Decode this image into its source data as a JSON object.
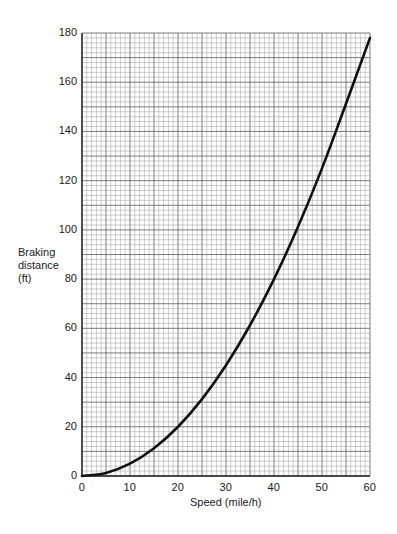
{
  "chart_data": {
    "type": "line",
    "title": "",
    "xlabel": "Speed (mile/h)",
    "ylabel": "Braking distance (ft)",
    "ylabel_lines": [
      "Braking",
      "distance",
      "(ft)"
    ],
    "xlim": [
      0,
      60
    ],
    "ylim": [
      0,
      180
    ],
    "x_ticks": [
      0,
      10,
      20,
      30,
      40,
      50,
      60
    ],
    "y_ticks": [
      0,
      20,
      40,
      60,
      80,
      100,
      120,
      140,
      160,
      180
    ],
    "grid": true,
    "legend": null,
    "series": [
      {
        "name": "Braking distance",
        "x": [
          0,
          5,
          10,
          15,
          20,
          25,
          30,
          35,
          40,
          45,
          50,
          55,
          60
        ],
        "y": [
          0,
          1.25,
          5,
          11.25,
          20,
          31.25,
          45,
          61.25,
          80,
          101.25,
          125,
          151.25,
          178
        ],
        "color": "#111111"
      }
    ]
  },
  "plot": {
    "left": 82,
    "right": 370,
    "top": 33,
    "bottom": 476,
    "grid_color_minor": "#9a9a9a",
    "grid_color_major": "#6e6e6e",
    "axis_color": "#222222"
  }
}
